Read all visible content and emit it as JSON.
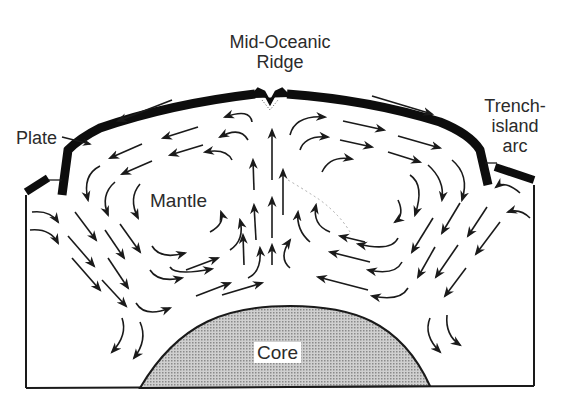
{
  "diagram": {
    "type": "mantle-convection-cross-section",
    "labels": {
      "ridge_line1": "Mid-Oceanic",
      "ridge_line2": "Ridge",
      "plate": "Plate",
      "trench_line1": "Trench-",
      "trench_line2": "island",
      "trench_line3": "arc",
      "mantle": "Mantle",
      "core": "Core"
    },
    "colors": {
      "ink": "#1a1a1a",
      "plate": "#0d0d0d",
      "core_fill": "#b8b8b8",
      "background": "#ffffff"
    },
    "elements": [
      "Thick black lithospheric plate arcing over mantle, split at central ridge",
      "Plate edges subduct down at left and right trench-island arcs",
      "Two convection cells with circulating arrows: rising beneath ridge, moving outward under plates, sinking at trenches",
      "Downward diagonal flow arrows near left and right walls",
      "Stippled grey dome representing the Core at the bottom center"
    ],
    "flow_directions": {
      "center": "upward",
      "under_left_plate": "leftward",
      "under_right_plate": "rightward",
      "left_wall": "downward",
      "right_wall": "downward",
      "above_core_left_cell": "rightward",
      "above_core_right_cell": "leftward"
    }
  }
}
